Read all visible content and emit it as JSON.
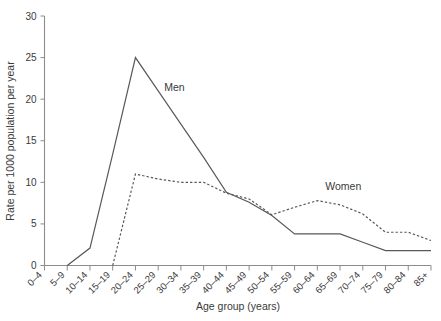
{
  "chart_data": {
    "type": "line",
    "title": "",
    "subtitle": "",
    "xlabel": "Age group (years)",
    "ylabel": "Rate per 1000 population per year",
    "grid": false,
    "legend_position": "inline-annotations",
    "ylim": [
      0,
      30
    ],
    "yticks": [
      0,
      5,
      10,
      15,
      20,
      25,
      30
    ],
    "ytick_labels": [
      "0",
      "5",
      "10",
      "15",
      "20",
      "25",
      "30"
    ],
    "categories": [
      "0–4",
      "5–9",
      "10–14",
      "15–19",
      "20–24",
      "25–29",
      "30–34",
      "35–39",
      "40–44",
      "45–49",
      "50–54",
      "55–59",
      "60–64",
      "65–69",
      "70–74",
      "75–79",
      "80–84",
      "85+"
    ],
    "series": [
      {
        "name": "Men",
        "style": "solid",
        "color": "#555a5e",
        "values": [
          0,
          0,
          2.1,
          13.4,
          25.0,
          21.0,
          17.0,
          13.0,
          8.8,
          7.6,
          6.0,
          3.8,
          3.8,
          3.8,
          2.8,
          1.8,
          1.8,
          1.8
        ]
      },
      {
        "name": "Women",
        "style": "dotted",
        "color": "#555a5e",
        "values": [
          0,
          0,
          0,
          0,
          11.0,
          10.4,
          10.0,
          10.0,
          8.7,
          8.0,
          6.1,
          7.0,
          7.8,
          7.3,
          6.2,
          4.0,
          4.0,
          3.0
        ]
      }
    ],
    "annotations": [
      {
        "text": "Men",
        "category": "25–29",
        "value": 21.0
      },
      {
        "text": "Women",
        "category": "60–64",
        "value": 8.4
      }
    ]
  },
  "axes": {
    "y_axis_label": "Rate per 1000 population per year",
    "x_axis_label": "Age group (years)"
  }
}
